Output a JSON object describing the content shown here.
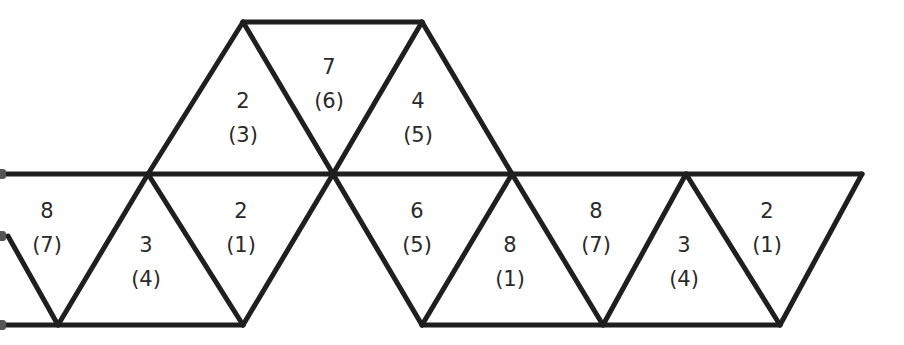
{
  "diagram": {
    "type": "octahedron net / triangular strip",
    "line_color": "#1f1f1f",
    "background": "#ffffff",
    "triangles": [
      {
        "id": "top-1",
        "number": "2",
        "paren": "(3)",
        "x": 243,
        "y": 118
      },
      {
        "id": "top-2",
        "number": "7",
        "paren": "(6)",
        "x": 329,
        "y": 84
      },
      {
        "id": "top-3",
        "number": "4",
        "paren": "(5)",
        "x": 418,
        "y": 118
      },
      {
        "id": "bot-1",
        "number": "8",
        "paren": "(7)",
        "x": 47,
        "y": 228
      },
      {
        "id": "bot-2",
        "number": "3",
        "paren": "(4)",
        "x": 147,
        "y": 262
      },
      {
        "id": "bot-3",
        "number": "2",
        "paren": "(1)",
        "x": 242,
        "y": 228
      },
      {
        "id": "bot-4",
        "number": "6",
        "paren": "(5)",
        "x": 417,
        "y": 228
      },
      {
        "id": "bot-5",
        "number": "8",
        "paren": "(1)",
        "x": 510,
        "y": 262
      },
      {
        "id": "bot-6",
        "number": "8",
        "paren": "(7)",
        "x": 597,
        "y": 228
      },
      {
        "id": "bot-7",
        "number": "3",
        "paren": "(4)",
        "x": 684,
        "y": 262
      },
      {
        "id": "bot-8",
        "number": "2",
        "paren": "(1)",
        "x": 767,
        "y": 228
      }
    ]
  }
}
